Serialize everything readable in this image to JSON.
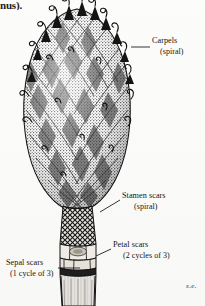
{
  "figure": {
    "background_color": "#fbfbfa",
    "ink_color": "#1b1b1b",
    "clipped_caption_text": "nus).",
    "signature": "s.e."
  },
  "labels": [
    {
      "name": "carpels",
      "text": "Carpels",
      "sub": "(spiral)",
      "x": 152,
      "y": 41,
      "leader": {
        "x1": 131,
        "y1": 47,
        "x2": 150,
        "y2": 47
      }
    },
    {
      "name": "stamen-scars",
      "text": "Stamen scars",
      "sub": "(spiral)",
      "x": 122,
      "y": 196,
      "leader": {
        "x1": 100,
        "y1": 212,
        "x2": 120,
        "y2": 200
      }
    },
    {
      "name": "petal-scars",
      "text": "Petal scars",
      "sub": "(2 cycles of 3)",
      "x": 113,
      "y": 245,
      "leader": {
        "x1": 96,
        "y1": 256,
        "x2": 111,
        "y2": 249
      }
    },
    {
      "name": "sepal-scars",
      "text": "Sepal scars",
      "sub": "(1 cycle of 3)",
      "x": 6,
      "y": 263,
      "leader": {
        "x1": 58,
        "y1": 268,
        "x2": 80,
        "y2": 268
      }
    }
  ],
  "structures": [
    {
      "name": "carpel-mass",
      "region": "ovoid cone, spiral carpels with curled stigma tips"
    },
    {
      "name": "stamen-scar-band",
      "region": "diamond cross-hatched collar below cone"
    },
    {
      "name": "petal-scar-band",
      "region": "two blocky scar rows on receptacle"
    },
    {
      "name": "sepal-scar-band",
      "region": "single scar row at stalk top"
    },
    {
      "name": "pedicel",
      "region": "pale vertically striated stalk"
    }
  ]
}
